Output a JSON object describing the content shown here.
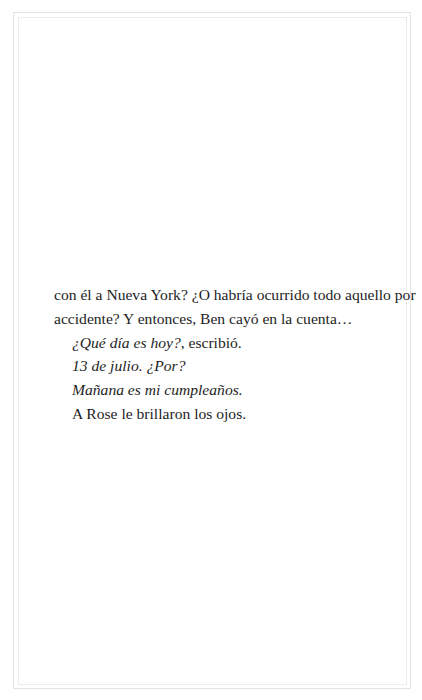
{
  "page": {
    "paragraphs": [
      {
        "id": "p1-line1",
        "indent": false,
        "segments": [
          {
            "text": "con él a Nueva York? ¿O habría ocurrido todo aquello por",
            "italic": false
          }
        ]
      },
      {
        "id": "p1-line2",
        "indent": false,
        "segments": [
          {
            "text": "accidente? Y entonces, Ben cayó en la cuenta…",
            "italic": false
          }
        ]
      },
      {
        "id": "p2",
        "indent": true,
        "segments": [
          {
            "text": "¿Qué día es hoy?",
            "italic": true
          },
          {
            "text": ", escribió.",
            "italic": false
          }
        ]
      },
      {
        "id": "p3",
        "indent": true,
        "segments": [
          {
            "text": "13 de julio. ¿Por?",
            "italic": true
          }
        ]
      },
      {
        "id": "p4",
        "indent": true,
        "segments": [
          {
            "text": "Mañana es mi cumpleaños.",
            "italic": true
          }
        ]
      },
      {
        "id": "p5",
        "indent": true,
        "segments": [
          {
            "text": "A Rose le brillaron los ojos.",
            "italic": false
          }
        ]
      }
    ]
  }
}
